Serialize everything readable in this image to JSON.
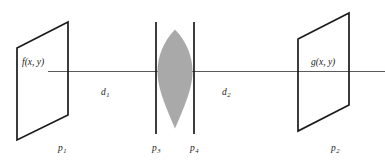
{
  "diagram": {
    "colors": {
      "stroke": "#1a1a1a",
      "axis": "#5a5a5a",
      "lens_fill": "#a9a9a9",
      "background": "#ffffff"
    },
    "planes": {
      "input": {
        "name": "p1",
        "plane_label": "p",
        "plane_subscript": "1",
        "field_label": "f(x, y)"
      },
      "output": {
        "name": "p2",
        "plane_label": "p",
        "plane_subscript": "2",
        "field_label": "g(x, y)"
      },
      "lens_front": {
        "name": "p3",
        "plane_label": "p",
        "plane_subscript": "3"
      },
      "lens_back": {
        "name": "p4",
        "plane_label": "p",
        "plane_subscript": "4"
      }
    },
    "distances": [
      {
        "name": "d1",
        "label": "d",
        "subscript": "1",
        "between": "p1-p3"
      },
      {
        "name": "d2",
        "label": "d",
        "subscript": "2",
        "between": "p4-p2"
      }
    ],
    "icons": {
      "lens": "biconvex-lens-icon",
      "optical_axis": "optical-axis-icon"
    }
  }
}
